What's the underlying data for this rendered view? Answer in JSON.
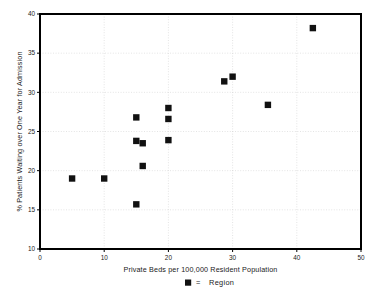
{
  "chart_data": {
    "type": "scatter",
    "title": "",
    "xlabel": "Private Beds per 100,000 Resident Population",
    "ylabel": "% Patients Waiting over One Year for Admission",
    "xlim": [
      0,
      50
    ],
    "ylim": [
      10,
      40
    ],
    "xticks": [
      "0",
      "10",
      "20",
      "30",
      "40",
      "50"
    ],
    "xtick_values": [
      0,
      10,
      20,
      30,
      40,
      50
    ],
    "yticks": [
      "10",
      "15",
      "20",
      "25",
      "30",
      "35",
      "40"
    ],
    "ytick_values": [
      10,
      15,
      20,
      25,
      30,
      35,
      40
    ],
    "grid": true,
    "grid_style": "dotted",
    "legend_position": "bottom-center",
    "series": [
      {
        "name": "Region",
        "marker": "filled-square",
        "color": "#111111",
        "points": [
          {
            "x": 5.0,
            "y": 19.0
          },
          {
            "x": 10.0,
            "y": 19.0
          },
          {
            "x": 15.0,
            "y": 15.7
          },
          {
            "x": 15.0,
            "y": 23.8
          },
          {
            "x": 15.0,
            "y": 26.8
          },
          {
            "x": 16.0,
            "y": 23.5
          },
          {
            "x": 16.0,
            "y": 20.6
          },
          {
            "x": 20.0,
            "y": 23.9
          },
          {
            "x": 20.0,
            "y": 26.6
          },
          {
            "x": 20.0,
            "y": 28.0
          },
          {
            "x": 28.7,
            "y": 31.4
          },
          {
            "x": 30.0,
            "y": 32.0
          },
          {
            "x": 35.5,
            "y": 28.4
          },
          {
            "x": 42.5,
            "y": 38.2
          }
        ]
      }
    ]
  },
  "legend": {
    "separator": "=",
    "entry_label": "Region"
  }
}
